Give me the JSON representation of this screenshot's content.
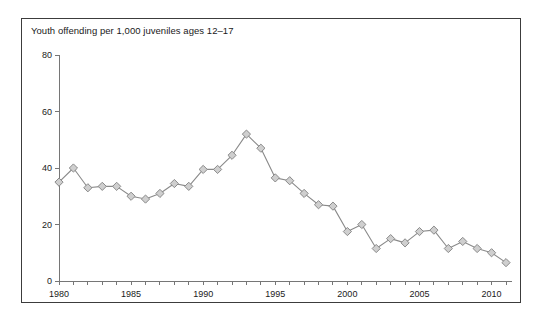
{
  "figure": {
    "title": "Youth offending per 1,000 juveniles ages 12–17",
    "border_color": "#3c3c3c",
    "background": "#ffffff"
  },
  "chart_data": {
    "type": "line",
    "title": "Youth offending per 1,000 juveniles ages 12–17",
    "xlabel": "",
    "ylabel": "",
    "xlim": [
      1979.5,
      2011.5
    ],
    "ylim": [
      0,
      80
    ],
    "grid": false,
    "legend": "none",
    "marker": "diamond",
    "marker_fill": "#cfcfcf",
    "marker_edge": "#8a8a8a",
    "line_color": "#8a8a8a",
    "y_ticks": [
      0,
      20,
      40,
      60,
      80
    ],
    "y_tick_labels": [
      "0",
      "20",
      "40",
      "60",
      "80"
    ],
    "x_ticks": [
      1980,
      1981,
      1982,
      1983,
      1984,
      1985,
      1986,
      1987,
      1988,
      1989,
      1990,
      1991,
      1992,
      1993,
      1994,
      1995,
      1996,
      1997,
      1998,
      1999,
      2000,
      2001,
      2002,
      2003,
      2004,
      2005,
      2006,
      2007,
      2008,
      2009,
      2010,
      2011
    ],
    "x_tick_labels_shown": [
      "1980",
      "1985",
      "1990",
      "1995",
      "2000",
      "2005",
      "2010"
    ],
    "x_labeled_ticks": [
      1980,
      1985,
      1990,
      1995,
      2000,
      2005,
      2010
    ],
    "x": [
      1980,
      1981,
      1982,
      1983,
      1984,
      1985,
      1986,
      1987,
      1988,
      1989,
      1990,
      1991,
      1992,
      1993,
      1994,
      1995,
      1996,
      1997,
      1998,
      1999,
      2000,
      2001,
      2002,
      2003,
      2004,
      2005,
      2006,
      2007,
      2008,
      2009,
      2010,
      2011
    ],
    "values": [
      35,
      40,
      33,
      33.5,
      33.5,
      30,
      29,
      31,
      34.5,
      33.5,
      39.5,
      39.5,
      44.5,
      52,
      47,
      36.5,
      35.5,
      31,
      27,
      26.5,
      17.5,
      20,
      11.5,
      15,
      13.5,
      17.5,
      18,
      11.5,
      14,
      11.5,
      10,
      6.5
    ]
  }
}
